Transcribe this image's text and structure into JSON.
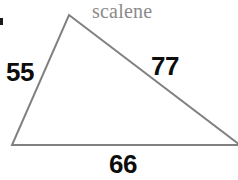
{
  "figure": {
    "shape_name": "scalene",
    "shape_name_color": "#8a8a8a",
    "stroke_color": "#808080",
    "label_color": "#0d0d0d",
    "background_color": "#ffffff",
    "width": 238,
    "height": 180,
    "cropped_right_edge": true
  },
  "chart_data": {
    "type": "diagram",
    "diagram_kind": "triangle",
    "title": "scalene",
    "classification": "scalene",
    "sides": [
      {
        "name": "left-side",
        "label": "55",
        "value": 55,
        "from_vertex": "bottom-left",
        "to_vertex": "apex"
      },
      {
        "name": "right-side",
        "label": "77",
        "value": 77,
        "from_vertex": "apex",
        "to_vertex": "bottom-right"
      },
      {
        "name": "base",
        "label": "66",
        "value": 66,
        "from_vertex": "bottom-left",
        "to_vertex": "bottom-right"
      }
    ],
    "vertices": [
      {
        "name": "apex",
        "x": 69,
        "y": 15
      },
      {
        "name": "bottom-left",
        "x": 12,
        "y": 145
      },
      {
        "name": "bottom-right",
        "x": 240,
        "y": 145
      }
    ],
    "side_labels": [
      "55",
      "77",
      "66"
    ],
    "side_values": [
      55,
      77,
      66
    ],
    "units": "",
    "grid": false,
    "legend": false
  },
  "labels": {
    "side_a": "55",
    "side_b": "77",
    "side_c": "66",
    "shape_name": "scalene"
  },
  "geometry": {
    "polygon_points": "69,15 240,145 12,145",
    "apex": {
      "x": 69,
      "y": 15
    },
    "bottom_left": {
      "x": 12,
      "y": 145
    },
    "bottom_right": {
      "x": 240,
      "y": 145
    },
    "stroke_width": 2
  }
}
